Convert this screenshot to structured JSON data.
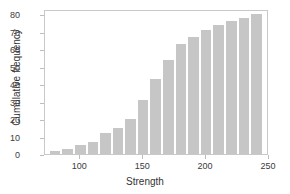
{
  "chart_data": {
    "type": "bar",
    "title": "",
    "subtitle": "",
    "xlabel": "Strength",
    "ylabel": "Cumulative frequency",
    "xlim": [
      72,
      250
    ],
    "ylim": [
      0,
      83
    ],
    "grid": false,
    "legend": null,
    "bar_color": "#c6c6c6",
    "bin_width": 10,
    "categories": [
      75,
      85,
      95,
      105,
      115,
      125,
      135,
      145,
      155,
      165,
      175,
      185,
      195,
      205,
      215,
      225,
      235
    ],
    "bin_starts": [
      75,
      85,
      95,
      105,
      115,
      125,
      135,
      145,
      155,
      165,
      175,
      185,
      195,
      205,
      215,
      225,
      235
    ],
    "bin_ends": [
      85,
      95,
      105,
      115,
      125,
      135,
      145,
      155,
      165,
      175,
      185,
      195,
      205,
      215,
      225,
      235,
      245
    ],
    "values": [
      2,
      3,
      5,
      7,
      12,
      15,
      20,
      31,
      43,
      54,
      63,
      67,
      71,
      74,
      76,
      78,
      80
    ],
    "xticks": [
      100,
      150,
      200,
      250
    ],
    "xtick_labels": [
      "100",
      "150",
      "200",
      "250"
    ],
    "yticks": [
      0,
      10,
      20,
      30,
      40,
      50,
      60,
      70,
      80
    ],
    "ytick_labels": [
      "0",
      "10",
      "20",
      "30",
      "40",
      "50",
      "60",
      "70",
      "80"
    ]
  }
}
